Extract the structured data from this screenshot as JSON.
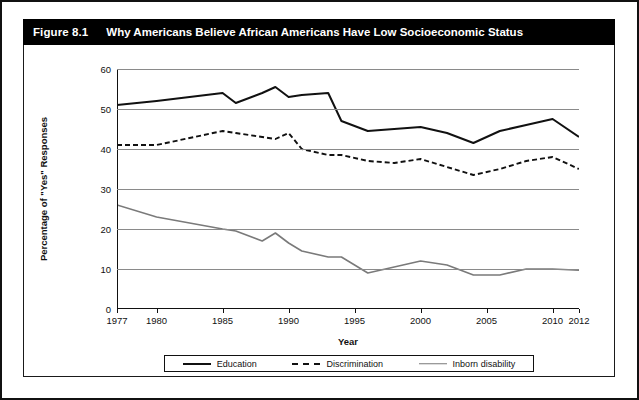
{
  "figure": {
    "label": "Figure 8.1",
    "title": "Why Americans Believe African Americans Have Low Socioeconomic Status"
  },
  "legend": {
    "items": [
      {
        "label": "Education",
        "style": "solid-black",
        "color": "#111111"
      },
      {
        "label": "Discrimination",
        "style": "dashed-black",
        "color": "#111111"
      },
      {
        "label": "Inborn disability",
        "style": "solid-grey",
        "color": "#7a7a7a"
      }
    ]
  },
  "chart_data": {
    "type": "line",
    "title": "Why Americans Believe African Americans Have Low Socioeconomic Status",
    "xlabel": "Year",
    "ylabel": "Percentage of \"Yes\" Responses",
    "xlim": [
      1977,
      2012
    ],
    "ylim": [
      0,
      60
    ],
    "yticks": [
      0,
      10,
      20,
      30,
      40,
      50,
      60
    ],
    "xticks": [
      1977,
      1980,
      1985,
      1990,
      1995,
      2000,
      2005,
      2010,
      2012
    ],
    "grid": "horizontal",
    "legend_position": "bottom",
    "x": [
      1977,
      1980,
      1985,
      1986,
      1988,
      1989,
      1990,
      1991,
      1993,
      1994,
      1996,
      1998,
      2000,
      2002,
      2004,
      2006,
      2008,
      2010,
      2012
    ],
    "series": [
      {
        "name": "Education",
        "values": [
          51,
          52,
          54,
          51.5,
          54,
          55.5,
          53,
          53.5,
          54,
          47,
          44.5,
          45,
          45.5,
          44,
          41.5,
          44.5,
          46,
          47.5,
          43
        ]
      },
      {
        "name": "Discrimination",
        "values": [
          41,
          41,
          44.5,
          44,
          43,
          42.5,
          44,
          40,
          38.5,
          38.5,
          37,
          36.5,
          37.5,
          35.5,
          33.5,
          35,
          37,
          38,
          35
        ]
      },
      {
        "name": "Inborn disability",
        "values": [
          26,
          23,
          20,
          19.5,
          17,
          19,
          16.5,
          14.5,
          13,
          13,
          9,
          10.5,
          12,
          11,
          8.5,
          8.5,
          10,
          10,
          9.7
        ]
      }
    ]
  }
}
